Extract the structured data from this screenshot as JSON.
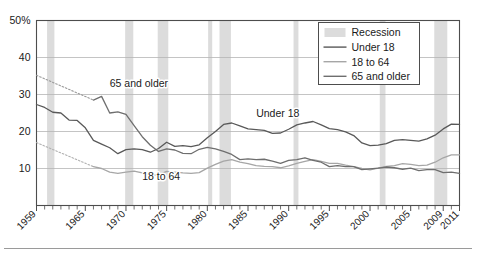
{
  "chart_data": {
    "type": "line",
    "title": "",
    "xlabel": "",
    "ylabel": "",
    "ylim": [
      0,
      50
    ],
    "xlim": [
      1959,
      2011
    ],
    "grid": "horizontal",
    "legend_position": "top-right",
    "y_ticks": [
      "10",
      "20",
      "30",
      "40",
      "50%"
    ],
    "y_tick_values": [
      10,
      20,
      30,
      40,
      50
    ],
    "x_ticks": [
      "1959",
      "1965",
      "1970",
      "1975",
      "1980",
      "1985",
      "1990",
      "1995",
      "2000",
      "2005",
      "2009",
      "2011"
    ],
    "x_tick_values": [
      1959,
      1965,
      1970,
      1975,
      1980,
      1985,
      1990,
      1995,
      2000,
      2005,
      2009,
      2011
    ],
    "annotations": [
      {
        "text": "65 and older",
        "x": 1968,
        "y": 32
      },
      {
        "text": "18 to 64",
        "x": 1972,
        "y": 7
      },
      {
        "text": "Under 18",
        "x": 1986,
        "y": 24
      }
    ],
    "recessions": [
      {
        "start": 1960.3,
        "end": 1961.2
      },
      {
        "start": 1969.9,
        "end": 1970.9
      },
      {
        "start": 1973.9,
        "end": 1975.2
      },
      {
        "start": 1980.1,
        "end": 1980.6
      },
      {
        "start": 1981.5,
        "end": 1982.9
      },
      {
        "start": 1990.6,
        "end": 1991.2
      },
      {
        "start": 2001.2,
        "end": 2001.9
      },
      {
        "start": 2007.9,
        "end": 2009.5
      }
    ],
    "series": [
      {
        "name": "Under 18",
        "color": "#595959",
        "style": "solid",
        "x": [
          1959,
          1960,
          1961,
          1962,
          1963,
          1964,
          1965,
          1966,
          1967,
          1968,
          1969,
          1970,
          1971,
          1972,
          1973,
          1974,
          1975,
          1976,
          1977,
          1978,
          1979,
          1980,
          1981,
          1982,
          1983,
          1984,
          1985,
          1986,
          1987,
          1988,
          1989,
          1990,
          1991,
          1992,
          1993,
          1994,
          1995,
          1996,
          1997,
          1998,
          1999,
          2000,
          2001,
          2002,
          2003,
          2004,
          2005,
          2006,
          2007,
          2008,
          2009,
          2010,
          2011
        ],
        "values": [
          27.3,
          26.5,
          25.2,
          25.0,
          23.1,
          23.0,
          21.0,
          17.6,
          16.6,
          15.6,
          14.0,
          15.1,
          15.3,
          15.1,
          14.4,
          15.4,
          17.1,
          16.0,
          16.2,
          15.9,
          16.4,
          18.3,
          20.0,
          21.9,
          22.3,
          21.5,
          20.7,
          20.5,
          20.3,
          19.5,
          19.6,
          20.6,
          21.8,
          22.3,
          22.7,
          21.8,
          20.8,
          20.5,
          19.9,
          18.9,
          16.9,
          16.2,
          16.3,
          16.7,
          17.6,
          17.8,
          17.6,
          17.4,
          18.0,
          19.0,
          20.7,
          22.0,
          21.9
        ]
      },
      {
        "name": "18 to 64",
        "color": "#a6a6a6",
        "style": "solid",
        "x": [
          1966,
          1967,
          1968,
          1969,
          1970,
          1971,
          1972,
          1973,
          1974,
          1975,
          1976,
          1977,
          1978,
          1979,
          1980,
          1981,
          1982,
          1983,
          1984,
          1985,
          1986,
          1987,
          1988,
          1989,
          1990,
          1991,
          1992,
          1993,
          1994,
          1995,
          1996,
          1997,
          1998,
          1999,
          2000,
          2001,
          2002,
          2003,
          2004,
          2005,
          2006,
          2007,
          2008,
          2009,
          2010,
          2011
        ],
        "values": [
          10.5,
          10.0,
          9.0,
          8.7,
          9.0,
          9.3,
          8.8,
          8.3,
          8.3,
          9.2,
          9.0,
          8.8,
          8.7,
          8.9,
          10.1,
          11.1,
          12.0,
          12.4,
          11.7,
          11.3,
          10.8,
          10.6,
          10.5,
          10.2,
          10.7,
          11.4,
          11.9,
          12.4,
          11.9,
          11.4,
          11.4,
          10.9,
          10.5,
          10.0,
          9.6,
          10.1,
          10.6,
          10.8,
          11.3,
          11.1,
          10.8,
          10.9,
          11.7,
          12.9,
          13.7,
          13.7
        ]
      },
      {
        "name": "65 and older",
        "color": "#6e6e6e",
        "style": "solid",
        "x": [
          1966,
          1967,
          1968,
          1969,
          1970,
          1971,
          1972,
          1973,
          1974,
          1975,
          1976,
          1977,
          1978,
          1979,
          1980,
          1981,
          1982,
          1983,
          1984,
          1985,
          1986,
          1987,
          1988,
          1989,
          1990,
          1991,
          1992,
          1993,
          1994,
          1995,
          1996,
          1997,
          1998,
          1999,
          2000,
          2001,
          2002,
          2003,
          2004,
          2005,
          2006,
          2007,
          2008,
          2009,
          2010,
          2011
        ],
        "values": [
          28.5,
          29.5,
          25.0,
          25.3,
          24.6,
          21.6,
          18.6,
          16.3,
          14.6,
          15.3,
          15.0,
          14.1,
          14.0,
          15.2,
          15.7,
          15.3,
          14.6,
          13.8,
          12.4,
          12.6,
          12.4,
          12.5,
          12.0,
          11.4,
          12.2,
          12.4,
          12.9,
          12.2,
          11.7,
          10.5,
          10.8,
          10.5,
          10.5,
          9.7,
          9.9,
          10.1,
          10.4,
          10.2,
          9.8,
          10.1,
          9.4,
          9.7,
          9.7,
          8.9,
          9.0,
          8.7
        ]
      }
    ],
    "series_dotted": [
      {
        "name": "65 and older",
        "color": "#9a9a9a",
        "style": "dotted",
        "x": [
          1959,
          1966
        ],
        "values": [
          35.2,
          28.5
        ]
      },
      {
        "name": "18 to 64",
        "color": "#b0b0b0",
        "style": "dotted",
        "x": [
          1959,
          1966
        ],
        "values": [
          17.0,
          10.5
        ]
      }
    ]
  },
  "legend": {
    "items": [
      {
        "label": "Recession",
        "kind": "band",
        "color": "#dcdcdc"
      },
      {
        "label": "Under 18",
        "kind": "line",
        "color": "#595959"
      },
      {
        "label": "18 to 64",
        "kind": "line",
        "color": "#a6a6a6"
      },
      {
        "label": "65 and older",
        "kind": "line",
        "color": "#6e6e6e"
      }
    ]
  },
  "style": {
    "plot_border": "#4d4d4d",
    "gridline": "#b5b5b5",
    "recession_band": "#dcdcdc",
    "text": "#1a1a1a",
    "background": "#ffffff"
  }
}
